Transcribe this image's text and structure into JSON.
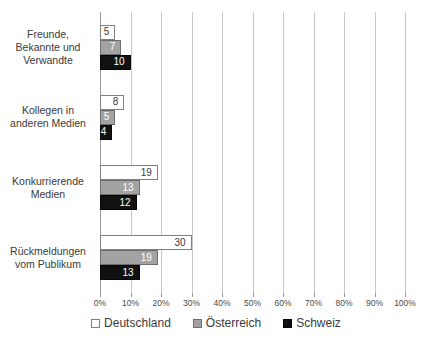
{
  "chart_data": {
    "type": "bar",
    "orientation": "horizontal",
    "title": "",
    "xlabel": "",
    "ylabel": "",
    "xlim": [
      0,
      100
    ],
    "grid": true,
    "legend_position": "bottom",
    "categories": [
      "Freunde, Bekannte und Verwandte",
      "Kollegen in anderen Medien",
      "Konkurrierende Medien",
      "Rückmeldungen vom Publikum"
    ],
    "category_lines": [
      [
        "Freunde,",
        "Bekannte und",
        "Verwandte"
      ],
      [
        "Kollegen in",
        "anderen Medien"
      ],
      [
        "Konkurrierende",
        "Medien"
      ],
      [
        "Rückmeldungen",
        "vom Publikum"
      ]
    ],
    "series": [
      {
        "name": "Deutschland",
        "color": "#ffffff",
        "border": "#808080",
        "values": [
          5,
          8,
          19,
          30
        ]
      },
      {
        "name": "Österreich",
        "color": "#a3a3a3",
        "border": "#6e6e6e",
        "values": [
          7,
          5,
          13,
          19
        ]
      },
      {
        "name": "Schweiz",
        "color": "#111111",
        "border": "#050505",
        "values": [
          10,
          4,
          12,
          13
        ]
      }
    ],
    "xticks": [
      0,
      10,
      20,
      30,
      40,
      50,
      60,
      70,
      80,
      90,
      100
    ],
    "xtick_labels": [
      "0%",
      "10%",
      "20%",
      "30%",
      "40%",
      "50%",
      "60%",
      "70%",
      "80%",
      "90%",
      "100%"
    ]
  },
  "legend": {
    "items": [
      {
        "label": "Deutschland",
        "swatch": "white-square-icon"
      },
      {
        "label": "Österreich",
        "swatch": "gray-square-icon"
      },
      {
        "label": "Schweiz",
        "swatch": "black-square-icon"
      }
    ]
  }
}
